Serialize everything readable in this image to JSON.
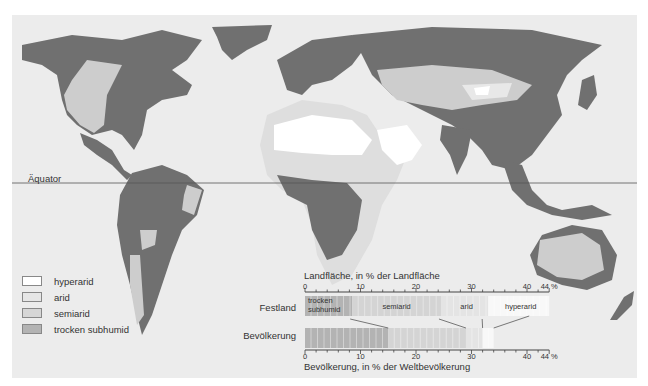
{
  "map": {
    "equator_label": "Äquator",
    "colors": {
      "background": "#ececec",
      "hyperarid": "#ffffff",
      "arid": "#e2e2e2",
      "semiarid": "#cdcdcd",
      "trocken_subhumid": "#b3b3b3",
      "humid_land": "#707070"
    }
  },
  "legend": {
    "items": [
      {
        "label": "hyperarid",
        "color": "#ffffff"
      },
      {
        "label": "arid",
        "color": "#e6e6e6"
      },
      {
        "label": "semiarid",
        "color": "#d6d6d6"
      },
      {
        "label": "trocken subhumid",
        "color": "#b3b3b3"
      }
    ]
  },
  "chart_data": {
    "type": "bar",
    "orientation": "horizontal-stacked",
    "title_top": "Landfläche, in % der Landfläche",
    "title_bottom": "Bevölkerung, in % der Weltbevölkerung",
    "categories": [
      "Festland",
      "Bevölkerung"
    ],
    "axis_ticks": [
      0,
      10,
      20,
      30,
      40,
      44
    ],
    "axis_tick_labels": [
      "0",
      "10",
      "20",
      "30",
      "40",
      "44 %"
    ],
    "xlim": [
      0,
      44
    ],
    "series": [
      {
        "name": "trocken subhumid",
        "label": "trocken subhumid",
        "values": [
          8.5,
          15
        ]
      },
      {
        "name": "semiarid",
        "label": "semiarid",
        "values": [
          16,
          14
        ]
      },
      {
        "name": "arid",
        "label": "arid",
        "values": [
          8.5,
          3
        ]
      },
      {
        "name": "hyperarid",
        "label": "hyperarid",
        "values": [
          11,
          2
        ]
      }
    ],
    "row_labels": {
      "top": "Festland",
      "bottom": "Bevölkerung"
    }
  }
}
